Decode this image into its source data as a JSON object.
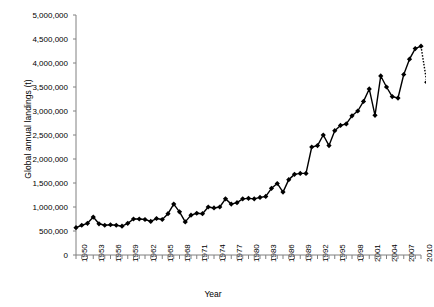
{
  "chart_data": {
    "type": "line",
    "title": "",
    "xlabel": "Year",
    "ylabel": "Global annual landings (t)",
    "xlim": [
      1950,
      2010
    ],
    "ylim": [
      0,
      5000000
    ],
    "ytick_labels": [
      "0",
      "500,000",
      "1,000,000",
      "1,500,000",
      "2,000,000",
      "2,500,000",
      "3,000,000",
      "3,500,000",
      "4,000,000",
      "4,500,000",
      "5,000,000"
    ],
    "ytick_values": [
      0,
      500000,
      1000000,
      1500000,
      2000000,
      2500000,
      3000000,
      3500000,
      4000000,
      4500000,
      5000000
    ],
    "xtick_labels": [
      "1950",
      "1953",
      "1956",
      "1959",
      "1962",
      "1965",
      "1968",
      "1971",
      "1974",
      "1977",
      "1980",
      "1983",
      "1986",
      "1989",
      "1992",
      "1995",
      "1998",
      "2001",
      "2004",
      "2007",
      "2010"
    ],
    "xtick_values": [
      1950,
      1953,
      1956,
      1959,
      1962,
      1965,
      1968,
      1971,
      1974,
      1977,
      1980,
      1983,
      1986,
      1989,
      1992,
      1995,
      1998,
      2001,
      2004,
      2007,
      2010
    ],
    "xtick_minor_step": 1,
    "grid": false,
    "legend": null,
    "marker": "diamond",
    "line_color": "#000000",
    "marker_color": "#000000",
    "x": [
      1950,
      1951,
      1952,
      1953,
      1954,
      1955,
      1956,
      1957,
      1958,
      1959,
      1960,
      1961,
      1962,
      1963,
      1964,
      1965,
      1966,
      1967,
      1968,
      1969,
      1970,
      1971,
      1972,
      1973,
      1974,
      1975,
      1976,
      1977,
      1978,
      1979,
      1980,
      1981,
      1982,
      1983,
      1984,
      1985,
      1986,
      1987,
      1988,
      1989,
      1990,
      1991,
      1992,
      1993,
      1994,
      1995,
      1996,
      1997,
      1998,
      1999,
      2000,
      2001,
      2002,
      2003,
      2004,
      2005,
      2006,
      2007,
      2008,
      2009,
      2010
    ],
    "values": [
      570000,
      620000,
      660000,
      790000,
      650000,
      620000,
      630000,
      620000,
      600000,
      660000,
      750000,
      750000,
      740000,
      700000,
      760000,
      740000,
      860000,
      1060000,
      900000,
      690000,
      830000,
      870000,
      860000,
      1000000,
      980000,
      1000000,
      1170000,
      1060000,
      1090000,
      1170000,
      1180000,
      1170000,
      1200000,
      1220000,
      1390000,
      1490000,
      1310000,
      1570000,
      1680000,
      1700000,
      1700000,
      2250000,
      2280000,
      2500000,
      2280000,
      2590000,
      2700000,
      2730000,
      2900000,
      3000000,
      3200000,
      3460000,
      2910000,
      3730000,
      3500000,
      3300000,
      3270000,
      3760000,
      4080000,
      4300000,
      4350000
    ],
    "tail_dotted_segment": {
      "from_year": 2010,
      "from_value": 4350000,
      "to_year": 2011,
      "to_value": 3600000
    },
    "tail_extra_point": {
      "year": 2011,
      "value": 3750000
    }
  }
}
